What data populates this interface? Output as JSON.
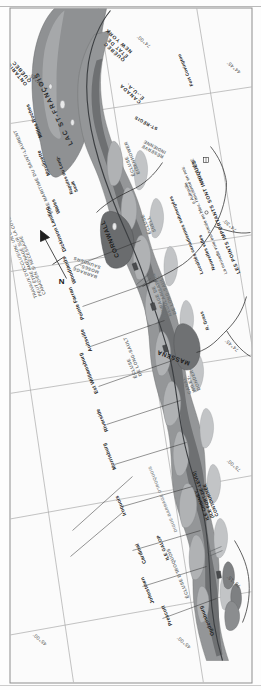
{
  "document": {
    "type": "historical-map",
    "subject": "Saint Lawrence Seaway / Voie maritime du Saint-Laurent",
    "orientation": "page rotated 90 degrees counter-clockwise",
    "north_arrow_label": "N"
  },
  "graticule": {
    "labels": [
      {
        "text": "45°00'",
        "kind": "latitude"
      },
      {
        "text": "45°00'",
        "kind": "latitude"
      },
      {
        "text": "44°45'",
        "kind": "latitude"
      },
      {
        "text": "44°45'",
        "kind": "latitude"
      },
      {
        "text": "75°15'",
        "kind": "longitude"
      },
      {
        "text": "75°00'",
        "kind": "longitude"
      },
      {
        "text": "74°45'",
        "kind": "longitude"
      },
      {
        "text": "74°30'",
        "kind": "longitude"
      },
      {
        "text": "74°00'",
        "kind": "longitude"
      }
    ]
  },
  "water_bodies": [
    {
      "name": "LAC ST-FRANÇOIS"
    },
    {
      "name": "VOIE MARITIME DU SAINT-LAURENT"
    },
    {
      "name": "R. Grass"
    }
  ],
  "cities": [
    {
      "name": "CORNWALL",
      "class": "major"
    },
    {
      "name": "MASSENA",
      "class": "major"
    },
    {
      "name": "Prescott"
    },
    {
      "name": "Johnstown"
    },
    {
      "name": "Ogdensburg"
    },
    {
      "name": "Cardinal"
    },
    {
      "name": "Iroquois"
    },
    {
      "name": "Morrisburg"
    },
    {
      "name": "Riverside"
    },
    {
      "name": "Est Williamsburg"
    },
    {
      "name": "Aultsville"
    },
    {
      "name": "Pointe Farran"
    },
    {
      "name": "Woodlands"
    },
    {
      "name": "Dickinson Landing"
    },
    {
      "name": "Wales"
    },
    {
      "name": "Moulinette"
    },
    {
      "name": "Milles Roches"
    },
    {
      "name": "Rapides du Long-Sault"
    },
    {
      "name": "Fort Covington"
    },
    {
      "name": "ST-RÉGIS"
    }
  ],
  "engineering_works": [
    {
      "label": "ÉCLUSE D'IROQUOIS"
    },
    {
      "label": "DIGUE-BARRAGE D'IROQUOIS"
    },
    {
      "label": "ILE GALOP"
    },
    {
      "label": "ILE CHIMNEY,\n(ILE FORT-DE-LEVIS)\nCONTOURNÉE"
    },
    {
      "label": "ÉCLUSE\nDE LONG-SAULT"
    },
    {
      "label": "ÉCLUSE\nSNELL"
    },
    {
      "label": "ÉCLUSE\nEISENHOWER"
    },
    {
      "label": "OUVRAGE DE RÉGULARISATION\nDE LONG-SAULT"
    },
    {
      "label": "CANAL\nWILEY-DONDERO"
    },
    {
      "label": "BARRAGE\nMOSES-SAUNDERS"
    },
    {
      "label": "RÉSERVE\nINDIENNE"
    }
  ],
  "annotations": [
    {
      "text": "TRAVAUX D'OCCLUSION; UN CANAL\nPEUT ÊTRE AMÉNAGÉ SUR LA CÔTE\nCANADIEN SI NÉCESSAIRE"
    }
  ],
  "boundaries": [
    {
      "text": "CANADA\nÉ.-U.A."
    },
    {
      "text": "QUÉBEC\nÉTAT DE\nNEW YORK"
    },
    {
      "text": "ONTARIO\nQUÉBEC"
    }
  ],
  "legend": {
    "rows": [
      {
        "title": "Localités canadiennes submergées",
        "leader": "········",
        "sample": "o Aultsville"
      },
      {
        "title": "Nouvelles villes",
        "leader": "············",
        "sample": "INGLESIDE"
      }
    ],
    "note": "La nouvelle voie est tracée en bleu, l'ancienne en noir.",
    "caps": "LES POINTS IMPORTANTS SONT INDIQUÉS"
  },
  "colors": {
    "water_fill": "#8f9193",
    "water_fill_light": "#b9bbbd",
    "paper": "#fbfbfb",
    "frame": "#8d8d8d",
    "graticule": "#a9a9a9",
    "ink": "#1c1c1c",
    "hydro_text": "#6f7476"
  }
}
